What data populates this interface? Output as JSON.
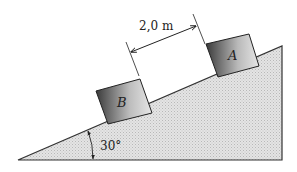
{
  "diagram": {
    "type": "inclined-plane",
    "incline": {
      "angle_label": "30°",
      "angle_deg": 30,
      "fill_color": "#d9d9d9",
      "edge_color": "#333333"
    },
    "blocks": [
      {
        "id": "A",
        "label": "A"
      },
      {
        "id": "B",
        "label": "B"
      }
    ],
    "distance": {
      "label": "2,0 m",
      "between": [
        "B",
        "A"
      ]
    },
    "colors": {
      "block_dark": "#3a3a3a",
      "block_light": "#d8d8d8",
      "line": "#222222"
    }
  }
}
